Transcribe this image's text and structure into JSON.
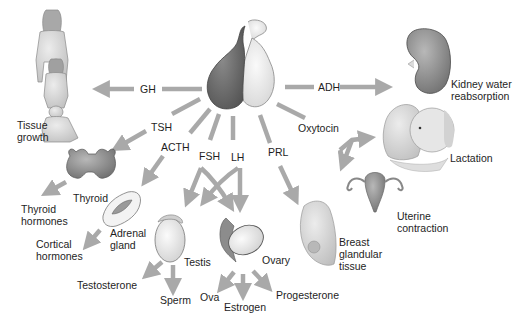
{
  "diagram": {
    "colors": {
      "arrow": "#a9a9a9",
      "anterior_lobe": "#6e6e6e",
      "posterior_lobe": "#ededed",
      "organ_fill": "#9a9a9a",
      "skin": "#d9d9d9",
      "text": "#1e1e1e",
      "background": "#ffffff"
    },
    "center": {
      "name": "Pituitary gland",
      "lobes": [
        "anterior",
        "posterior"
      ]
    },
    "hormones": {
      "gh": "GH",
      "tsh": "TSH",
      "acth": "ACTH",
      "fsh": "FSH",
      "lh": "LH",
      "prl": "PRL",
      "oxytocin": "Oxytocin",
      "adh": "ADH"
    },
    "targets": {
      "tissue_growth": "Tissue growth",
      "thyroid": "Thyroid",
      "thyroid_hormones": "Thyroid hormones",
      "adrenal_gland": "Adrenal gland",
      "cortical_hormones": "Cortical hormones",
      "testis": "Testis",
      "testosterone": "Testosterone",
      "sperm": "Sperm",
      "ovary": "Ovary",
      "ova": "Ova",
      "estrogen": "Estrogen",
      "progesterone": "Progesterone",
      "breast": "Breast glandular tissue",
      "uterine": "Uterine contraction",
      "lactation": "Lactation",
      "kidney": "Kidney water reabsorption"
    },
    "connections": [
      {
        "hormone": "GH",
        "from": "Pituitary gland",
        "to": "Tissue growth"
      },
      {
        "hormone": "TSH",
        "from": "Pituitary gland",
        "to": "Thyroid"
      },
      {
        "hormone": "ACTH",
        "from": "Pituitary gland",
        "to": "Adrenal gland"
      },
      {
        "hormone": "FSH",
        "from": "Pituitary gland",
        "to": [
          "Testis",
          "Ovary"
        ]
      },
      {
        "hormone": "LH",
        "from": "Pituitary gland",
        "to": [
          "Testis",
          "Ovary"
        ]
      },
      {
        "hormone": "PRL",
        "from": "Pituitary gland",
        "to": "Breast glandular tissue"
      },
      {
        "hormone": "Oxytocin",
        "from": "Pituitary gland",
        "to": [
          "Lactation",
          "Uterine contraction"
        ]
      },
      {
        "hormone": "ADH",
        "from": "Pituitary gland",
        "to": "Kidney water reabsorption"
      },
      {
        "from": "Thyroid",
        "to": "Thyroid hormones"
      },
      {
        "from": "Adrenal gland",
        "to": "Cortical hormones"
      },
      {
        "from": "Testis",
        "to": [
          "Testosterone",
          "Sperm"
        ]
      },
      {
        "from": "Ovary",
        "to": [
          "Ova",
          "Estrogen",
          "Progesterone"
        ]
      }
    ]
  }
}
